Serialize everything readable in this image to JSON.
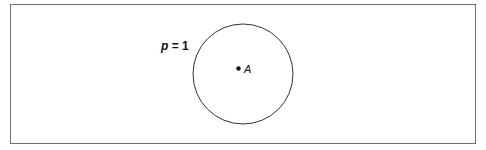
{
  "diagram": {
    "label": "p = 1",
    "label_var": "p",
    "label_rest": " = 1",
    "point_label": "A",
    "circle": {
      "cx": 243,
      "cy": 74,
      "r": 50
    },
    "point": {
      "x": 238,
      "y": 68
    },
    "stroke_color": "#333333"
  }
}
